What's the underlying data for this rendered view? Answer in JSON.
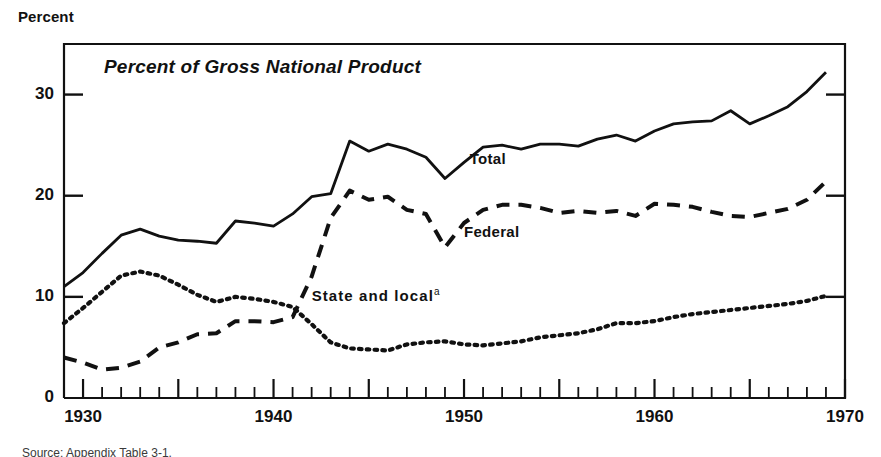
{
  "figure": {
    "y_axis_title": "Percent",
    "chart_title": "Percent of Gross National Product",
    "footnote": "Source: Appendix Table 3-1."
  },
  "labels": {
    "total": "Total",
    "federal": "Federal",
    "state_local": "State and local",
    "state_local_sup": "a"
  },
  "colors": {
    "ink": "#111111",
    "background": "#ffffff"
  },
  "chart_data": {
    "type": "line",
    "title": "Percent of Gross National Product",
    "xlabel": "",
    "ylabel": "Percent",
    "xlim": [
      1929,
      1970
    ],
    "ylim": [
      0,
      35
    ],
    "yticks": [
      0,
      10,
      20,
      30
    ],
    "xticks": [
      1930,
      1940,
      1950,
      1960,
      1970
    ],
    "xtick_labels": [
      "1930",
      "1940",
      "1950",
      "1960",
      "1970"
    ],
    "ytick_labels": [
      "0",
      "10",
      "20",
      "30"
    ],
    "minor_xtick_interval": 1,
    "major_xtick_interval": 5,
    "grid": false,
    "legend": "inline-annotations",
    "annotations": [
      {
        "text": "Total",
        "x": 1950.3,
        "y": 23.6
      },
      {
        "text": "Federal",
        "x": 1950.0,
        "y": 16.4
      },
      {
        "text": "State and local",
        "x": 1942.0,
        "y": 10.2
      }
    ],
    "x": [
      1929,
      1930,
      1931,
      1932,
      1933,
      1934,
      1935,
      1936,
      1937,
      1938,
      1939,
      1940,
      1941,
      1942,
      1943,
      1944,
      1945,
      1946,
      1947,
      1948,
      1949,
      1950,
      1951,
      1952,
      1953,
      1954,
      1955,
      1956,
      1957,
      1958,
      1959,
      1960,
      1961,
      1962,
      1963,
      1964,
      1965,
      1966,
      1967,
      1968,
      1969
    ],
    "series": [
      {
        "name": "Total",
        "style": "solid",
        "values": [
          11.0,
          12.4,
          14.3,
          16.1,
          16.7,
          16.0,
          15.6,
          15.5,
          15.3,
          17.5,
          17.3,
          17.0,
          18.2,
          19.9,
          20.2,
          25.4,
          24.4,
          25.1,
          24.6,
          23.8,
          21.7,
          23.3,
          24.8,
          25.0,
          24.6,
          25.1,
          25.1,
          24.9,
          25.6,
          26.0,
          25.4,
          26.4,
          27.1,
          27.3,
          27.4,
          28.4,
          27.1,
          27.9,
          28.8,
          30.3,
          32.2
        ]
      },
      {
        "name": "Federal",
        "style": "dashed",
        "values": [
          4.0,
          3.5,
          2.8,
          3.0,
          3.6,
          5.0,
          5.5,
          6.3,
          6.4,
          7.6,
          7.6,
          7.5,
          8.0,
          12.0,
          17.8,
          20.5,
          19.6,
          19.9,
          18.6,
          18.2,
          14.9,
          17.3,
          18.6,
          19.1,
          19.1,
          18.8,
          18.3,
          18.5,
          18.3,
          18.5,
          18.0,
          19.2,
          19.1,
          18.9,
          18.4,
          18.0,
          17.9,
          18.3,
          18.7,
          19.6,
          21.4
        ]
      },
      {
        "name": "State and local",
        "style": "dotted",
        "values": [
          7.4,
          8.9,
          10.5,
          12.1,
          12.5,
          12.1,
          11.2,
          10.2,
          9.5,
          10.0,
          9.8,
          9.5,
          9.0,
          7.3,
          5.5,
          4.9,
          4.8,
          4.7,
          5.3,
          5.5,
          5.6,
          5.3,
          5.2,
          5.4,
          5.6,
          6.0,
          6.2,
          6.4,
          6.8,
          7.4,
          7.4,
          7.6,
          8.0,
          8.3,
          8.5,
          8.7,
          8.9,
          9.1,
          9.3,
          9.6,
          10.1
        ]
      }
    ]
  }
}
